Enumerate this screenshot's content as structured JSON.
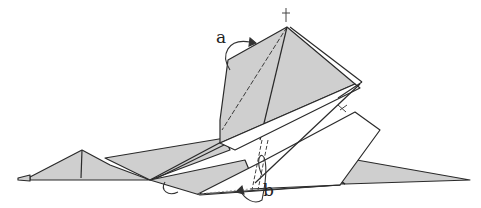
{
  "diagram": {
    "type": "origami-folding-step",
    "labels": [
      {
        "id": "a",
        "text": "a"
      },
      {
        "id": "b",
        "text": "b"
      }
    ],
    "colors": {
      "paper": "#cfcfcf",
      "paper_light": "#ffffff",
      "line": "#2a2a2a"
    }
  }
}
